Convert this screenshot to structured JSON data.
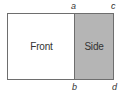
{
  "diagram": {
    "faces": {
      "front": {
        "label": "Front",
        "fill": "#ffffff"
      },
      "side": {
        "label": "Side",
        "fill": "#b5b5b5"
      }
    },
    "points": {
      "a": "a",
      "b": "b",
      "c": "c",
      "d": "d"
    },
    "stroke_color": "#6e6e6e"
  }
}
